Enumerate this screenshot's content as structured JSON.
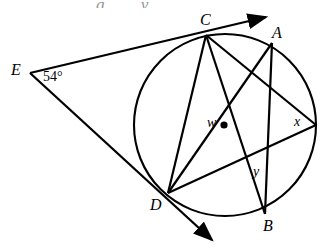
{
  "figure": {
    "canvas": {
      "width": 328,
      "height": 249,
      "background": "#ffffff"
    },
    "stroke_color": "#000000",
    "circle": {
      "cx": 225,
      "cy": 125,
      "r": 91
    },
    "points": {
      "A": {
        "label": "A",
        "x": 272,
        "y": 43,
        "label_x": 272,
        "label_y": 25
      },
      "B": {
        "label": "B",
        "x": 265,
        "y": 214,
        "label_x": 263,
        "label_y": 218
      },
      "C": {
        "label": "C",
        "x": 206,
        "y": 35,
        "label_x": 200,
        "label_y": 14
      },
      "D": {
        "label": "D",
        "x": 168,
        "y": 193,
        "label_x": 151,
        "label_y": 197
      },
      "E": {
        "label": "E",
        "x": 30,
        "y": 73,
        "label_x": 12,
        "label_y": 62
      },
      "F": {
        "label": "",
        "x": 316,
        "y": 125,
        "label_x": 0,
        "label_y": 0
      }
    },
    "angles": {
      "E": {
        "label": "54°",
        "value": 54,
        "unit": "degrees",
        "x": 43,
        "y": 71
      },
      "w": {
        "label": "w",
        "x": 208,
        "y": 117
      },
      "x": {
        "label": "x",
        "x": 295,
        "y": 116
      },
      "y": {
        "label": "y",
        "x": 254,
        "y": 166
      }
    },
    "intersections": {
      "w_point": {
        "x": 224,
        "y": 125,
        "marker": "filled-dot"
      },
      "y_point": {
        "x": 262,
        "y": 163,
        "marker": "none"
      }
    },
    "segments": [
      {
        "name": "ray-E-C",
        "from": "E",
        "to": "C",
        "arrow": "end"
      },
      {
        "name": "ray-E-D",
        "from": "E",
        "to": "D",
        "arrow": "end"
      },
      {
        "name": "chord-C-D",
        "from": "C",
        "to": "D",
        "arrow": "none"
      },
      {
        "name": "chord-C-B",
        "from": "C",
        "to": "B",
        "arrow": "none"
      },
      {
        "name": "chord-C-F",
        "from": "C",
        "to": "F",
        "arrow": "none"
      },
      {
        "name": "chord-D-A",
        "from": "D",
        "to": "A",
        "arrow": "none"
      },
      {
        "name": "chord-D-F",
        "from": "D",
        "to": "F",
        "arrow": "none"
      },
      {
        "name": "chord-A-B",
        "from": "A",
        "to": "B",
        "arrow": "none"
      }
    ],
    "smudge_text": "g y"
  }
}
